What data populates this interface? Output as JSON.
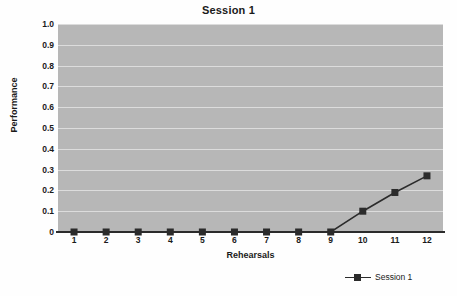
{
  "chart_data": {
    "type": "line",
    "title": "Session 1",
    "xlabel": "Rehearsals",
    "ylabel": "Performance",
    "x": [
      1,
      2,
      3,
      4,
      5,
      6,
      7,
      8,
      9,
      10,
      11,
      12
    ],
    "categories": [
      "1",
      "2",
      "3",
      "4",
      "5",
      "6",
      "7",
      "8",
      "9",
      "10",
      "11",
      "12"
    ],
    "series": [
      {
        "name": "Session 1",
        "values": [
          0,
          0,
          0,
          0,
          0,
          0,
          0,
          0,
          0,
          0.1,
          0.19,
          0.27
        ]
      }
    ],
    "xlim": [
      0.5,
      12.5
    ],
    "ylim": [
      0,
      1.0
    ],
    "y_ticks": [
      0,
      0.1,
      0.2,
      0.3,
      0.4,
      0.5,
      0.6,
      0.7,
      0.8,
      0.9,
      1.0
    ],
    "y_tick_labels": [
      "0",
      "0.1",
      "0.2",
      "0.3",
      "0.4",
      "0.5",
      "0.6",
      "0.7",
      "0.8",
      "0.9",
      "1.0"
    ],
    "grid": true,
    "legend_position": "bottom-right",
    "colors": {
      "plot_background": "#b7b7b7",
      "gridline": "#dcdcdc",
      "series_line": "#2b2b2b",
      "marker": "#2b2b2b",
      "text": "#1a1a1a",
      "page_background": "#fefefe"
    }
  },
  "legend": {
    "entries": [
      {
        "label": "Session 1",
        "marker": "square-marker-icon"
      }
    ]
  }
}
